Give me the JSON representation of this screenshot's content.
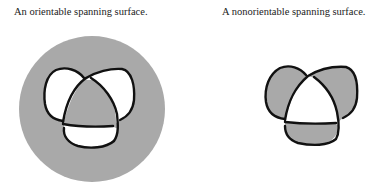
{
  "figures": [
    {
      "caption": "An orientable spanning surface.",
      "surface_type": "orientable",
      "knot": "trefoil",
      "colors": {
        "surface": "#a9a9a9",
        "background": "#ffffff",
        "strand": "#111111"
      }
    },
    {
      "caption": "A nonorientable spanning surface.",
      "surface_type": "nonorientable",
      "knot": "trefoil",
      "colors": {
        "surface": "#a9a9a9",
        "background": "#ffffff",
        "strand": "#111111"
      }
    }
  ]
}
